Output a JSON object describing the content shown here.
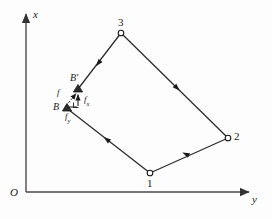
{
  "figure": {
    "type": "mechanics-diagram",
    "background_color": "#fdfdfd",
    "line_color": "#2b2b2b",
    "axes": {
      "origin_label": "O",
      "vertical_axis_label": "x",
      "horizontal_axis_label": "y",
      "origin_px": [
        26,
        192
      ],
      "vertical_tip_px": [
        26,
        12
      ],
      "horizontal_tip_px": [
        251,
        192
      ]
    },
    "nodes": [
      {
        "id": "n1",
        "label": "1",
        "x": 150,
        "y": 173,
        "marker": "circle",
        "label_dx": -3,
        "label_dy": 9
      },
      {
        "id": "n2",
        "label": "2",
        "x": 228,
        "y": 138,
        "marker": "circle",
        "label_dx": 6,
        "label_dy": -3
      },
      {
        "id": "n3",
        "label": "3",
        "x": 121,
        "y": 33,
        "marker": "circle",
        "label_dx": -3,
        "label_dy": -15
      }
    ],
    "points": [
      {
        "id": "B",
        "label": "B",
        "x": 67,
        "y": 108,
        "marker": "triangle",
        "label_dx": -13,
        "label_dy": -4
      },
      {
        "id": "Bprime",
        "label": "B'",
        "x": 78,
        "y": 89,
        "marker": "triangle",
        "label_dx": -8,
        "label_dy": -14
      }
    ],
    "edges": [
      {
        "from": "n3",
        "to": "Bprime",
        "arrow_at": 0.52,
        "arrow_dir": "toward-to"
      },
      {
        "from": "n3",
        "to": "n2",
        "arrow_at": 0.5,
        "arrow_dir": "toward-to"
      },
      {
        "from": "n2",
        "to": "n1",
        "arrow_at": 0.5,
        "arrow_dir": "toward-to"
      },
      {
        "from": "n1",
        "to": "B",
        "arrow_at": 0.5,
        "arrow_dir": "toward-to"
      }
    ],
    "force_vectors": [
      {
        "id": "f",
        "label": "f",
        "subscript": "",
        "style": "dashed-arrow",
        "from": [
          67,
          107
        ],
        "to": [
          78,
          92
        ],
        "label_x": 55,
        "label_y": 92
      },
      {
        "id": "fx",
        "label": "f",
        "subscript": "x",
        "style": "solid-arrow-vertical",
        "from": [
          78,
          104
        ],
        "to": [
          78,
          92
        ],
        "label_x": 85,
        "label_y": 99
      },
      {
        "id": "fy",
        "label": "f",
        "subscript": "y",
        "style": "solid-arrow-horizontal",
        "from": [
          68,
          107
        ],
        "to": [
          78,
          107
        ],
        "label_x": 66,
        "label_y": 116
      }
    ]
  }
}
